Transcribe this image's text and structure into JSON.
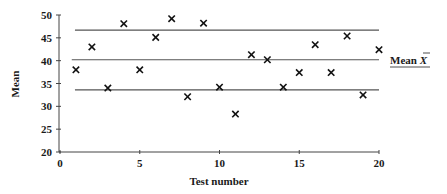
{
  "chart_data": {
    "type": "scatter",
    "title": "",
    "xlabel": "Test number",
    "ylabel": "Mean",
    "xlim": [
      0,
      20
    ],
    "ylim": [
      20,
      50
    ],
    "x_ticks": [
      0,
      5,
      10,
      15,
      20
    ],
    "y_ticks": [
      20,
      25,
      30,
      35,
      40,
      45,
      50
    ],
    "grid": false,
    "legend": null,
    "marker": "x",
    "series": [
      {
        "name": "Sample means",
        "x": [
          1,
          2,
          3,
          4,
          5,
          6,
          7,
          8,
          9,
          10,
          11,
          12,
          13,
          14,
          15,
          16,
          17,
          18,
          19,
          20
        ],
        "y": [
          38.0,
          43.0,
          34.0,
          48.1,
          38.0,
          45.1,
          49.2,
          32.1,
          48.2,
          34.2,
          28.3,
          41.3,
          40.2,
          34.2,
          37.4,
          43.5,
          37.4,
          45.4,
          32.5,
          42.4
        ]
      }
    ],
    "reference_lines": [
      {
        "name": "upper-limit",
        "y": 46.7,
        "x_start": 1,
        "x_end": 20
      },
      {
        "name": "mean",
        "y": 40.2,
        "x_start": 0.8,
        "x_end": 20,
        "label": "Mean X̄"
      },
      {
        "name": "lower-limit",
        "y": 33.6,
        "x_start": 1,
        "x_end": 20
      }
    ],
    "annotations": [
      {
        "text": "Mean X̄",
        "attached_to": "mean",
        "position": "right",
        "underlined": true
      }
    ]
  },
  "labels": {
    "xlabel": "Test number",
    "ylabel": "Mean",
    "mean_label_word": "Mean ",
    "mean_label_symbol": "X"
  }
}
